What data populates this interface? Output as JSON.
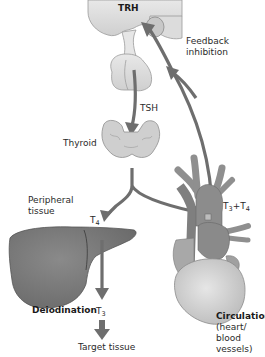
{
  "diagram": {
    "labels": {
      "trh": "TRH",
      "feedback_line1": "Feedback",
      "feedback_line2": "inhibition",
      "tsh": "TSH",
      "thyroid": "Thyroid",
      "peripheral_line1": "Peripheral",
      "peripheral_line2": "tissue",
      "t4_base": "T",
      "t4_sub": "4",
      "t3t4_t": "T",
      "t3t4_sub3": "3",
      "t3t4_plus": "+T",
      "t3t4_sub4": "4",
      "deiodination": "Deiodination",
      "t3_base": "T",
      "t3_sub": "3",
      "target_tissue": "Target tissue",
      "circulation": "Circulation",
      "circ_line2": "(heart/",
      "circ_line3": "blood",
      "circ_line4": "vessels)"
    },
    "colors": {
      "arrow": "#6e6e6e",
      "arrow_stroke": "#4a4a4a",
      "brain": "#d9d9d9",
      "pituitary": "#e2e2e2",
      "thyroid": "#cfcfcf",
      "liver": "#7a7a7a",
      "heart_light": "#d4d4d4",
      "heart_dark": "#858585",
      "vessels": "#8f8f8f"
    }
  }
}
